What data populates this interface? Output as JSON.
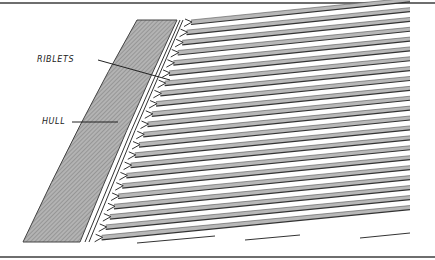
{
  "figure": {
    "labels": {
      "riblets": "RIBLETS",
      "hull": "HULL"
    },
    "colors": {
      "hull_fill": "#a9a9a9",
      "stripe_fill": "#b8b8b8",
      "line": "#333333",
      "frame": "#6e6e6e",
      "background": "#ffffff"
    },
    "riblet_count": 22
  }
}
